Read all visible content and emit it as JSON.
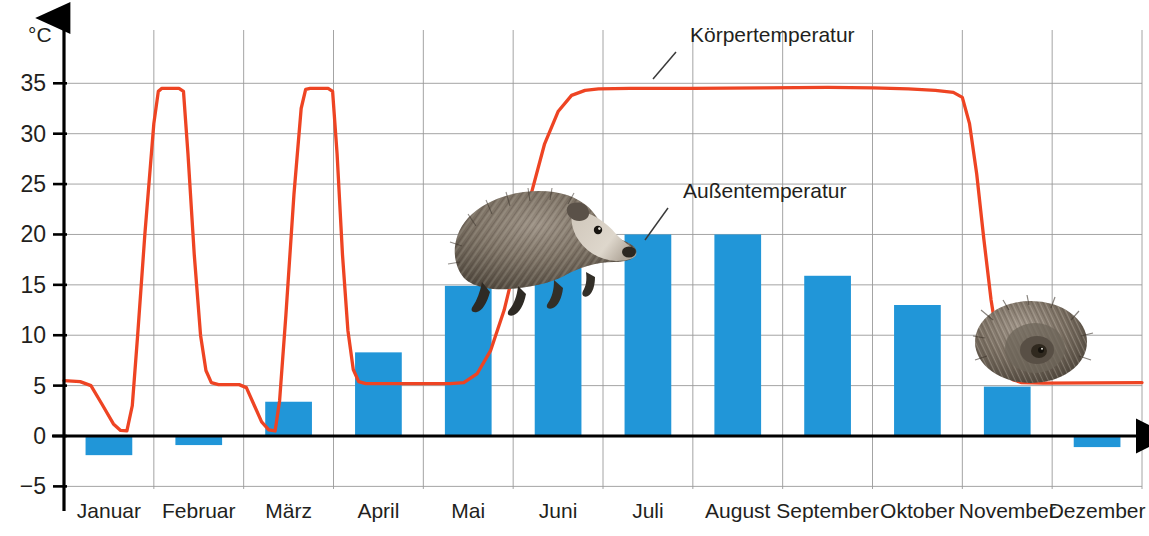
{
  "chart_data": {
    "type": "bar",
    "title": "",
    "xlabel": "",
    "ylabel": "°C",
    "ylim": [
      -5,
      37
    ],
    "xlim": [
      0,
      12
    ],
    "grid": true,
    "legend": "inline-annotations",
    "categories": [
      "Januar",
      "Februar",
      "März",
      "April",
      "Mai",
      "Juni",
      "Juli",
      "August",
      "September",
      "Oktober",
      "November",
      "Dezember"
    ],
    "ytick_labels": [
      "35",
      "30",
      "25",
      "20",
      "15",
      "10",
      "5",
      "0",
      "-5"
    ],
    "ytick_values": [
      35,
      30,
      25,
      20,
      15,
      10,
      5,
      0,
      -5
    ],
    "series": [
      {
        "name": "Außentemperatur",
        "type": "bar",
        "color": "#2196d8",
        "values": [
          -1.9,
          -0.9,
          3.4,
          8.3,
          14.9,
          16.7,
          20.0,
          20.0,
          15.9,
          13.0,
          4.9,
          -1.1
        ]
      },
      {
        "name": "Körpertemperatur",
        "type": "line",
        "color": "#ee4423",
        "points": [
          [
            0.0,
            5.5
          ],
          [
            0.18,
            5.4
          ],
          [
            0.3,
            5.0
          ],
          [
            0.42,
            3.2
          ],
          [
            0.55,
            1.2
          ],
          [
            0.63,
            0.55
          ],
          [
            0.7,
            0.5
          ],
          [
            0.76,
            3.0
          ],
          [
            0.82,
            10.0
          ],
          [
            0.9,
            20.0
          ],
          [
            1.0,
            31.0
          ],
          [
            1.05,
            34.2
          ],
          [
            1.09,
            34.5
          ],
          [
            1.28,
            34.5
          ],
          [
            1.33,
            34.2
          ],
          [
            1.38,
            28.0
          ],
          [
            1.45,
            18.0
          ],
          [
            1.52,
            10.0
          ],
          [
            1.58,
            6.5
          ],
          [
            1.64,
            5.3
          ],
          [
            1.72,
            5.1
          ],
          [
            1.95,
            5.1
          ],
          [
            2.03,
            4.8
          ],
          [
            2.12,
            3.0
          ],
          [
            2.2,
            1.4
          ],
          [
            2.28,
            0.6
          ],
          [
            2.35,
            0.5
          ],
          [
            2.4,
            3.5
          ],
          [
            2.47,
            12.0
          ],
          [
            2.56,
            24.0
          ],
          [
            2.64,
            32.5
          ],
          [
            2.69,
            34.4
          ],
          [
            2.74,
            34.5
          ],
          [
            2.94,
            34.5
          ],
          [
            2.99,
            34.2
          ],
          [
            3.04,
            28.0
          ],
          [
            3.1,
            18.0
          ],
          [
            3.16,
            10.5
          ],
          [
            3.22,
            6.6
          ],
          [
            3.28,
            5.4
          ],
          [
            3.36,
            5.2
          ],
          [
            4.3,
            5.2
          ],
          [
            4.45,
            5.3
          ],
          [
            4.6,
            6.2
          ],
          [
            4.75,
            8.5
          ],
          [
            4.9,
            12.5
          ],
          [
            5.05,
            18.0
          ],
          [
            5.2,
            24.0
          ],
          [
            5.35,
            29.0
          ],
          [
            5.5,
            32.2
          ],
          [
            5.65,
            33.8
          ],
          [
            5.8,
            34.3
          ],
          [
            5.95,
            34.45
          ],
          [
            6.3,
            34.5
          ],
          [
            7.0,
            34.5
          ],
          [
            7.8,
            34.55
          ],
          [
            8.5,
            34.6
          ],
          [
            9.0,
            34.55
          ],
          [
            9.4,
            34.45
          ],
          [
            9.7,
            34.3
          ],
          [
            9.9,
            34.1
          ],
          [
            10.0,
            33.6
          ],
          [
            10.08,
            31.0
          ],
          [
            10.16,
            26.0
          ],
          [
            10.24,
            19.5
          ],
          [
            10.32,
            13.5
          ],
          [
            10.4,
            9.0
          ],
          [
            10.48,
            6.6
          ],
          [
            10.56,
            5.6
          ],
          [
            10.66,
            5.3
          ],
          [
            10.9,
            5.25
          ],
          [
            12.0,
            5.3
          ]
        ]
      }
    ],
    "annotations": [
      {
        "text": "Körpertemperatur",
        "anchor_month": 7.05,
        "anchor_value": 34.6
      },
      {
        "text": "Außentemperatur",
        "anchor_month": 6.02,
        "anchor_value": 19.4
      }
    ]
  },
  "axis": {
    "unit": "°C"
  },
  "images": [
    {
      "name": "hedgehog-walking",
      "alt": "Igel laufend"
    },
    {
      "name": "hedgehog-curled",
      "alt": "Igel eingerollt"
    }
  ],
  "colors": {
    "bar": "#2196d8",
    "line": "#ee4423",
    "grid": "#9a9a9a",
    "axis": "#000000",
    "text": "#231f20"
  }
}
